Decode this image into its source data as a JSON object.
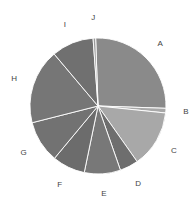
{
  "chart_data": {
    "type": "pie",
    "title": "",
    "categories": [
      "A",
      "B",
      "C",
      "D",
      "E",
      "F",
      "G",
      "H",
      "I",
      "J"
    ],
    "values": [
      26.1,
      1.1,
      13.6,
      4.4,
      8.6,
      7.8,
      10.0,
      17.8,
      10.0,
      0.6
    ],
    "colors": [
      "#8a8a8a",
      "#a8a8a8",
      "#a8a8a8",
      "#6e6e6e",
      "#787878",
      "#6c6c6c",
      "#727272",
      "#767676",
      "#707070",
      "#9a9a9a"
    ],
    "start_angle_deg": -2,
    "direction": "clockwise",
    "legend": "none",
    "labels_outside": true
  },
  "geometry": {
    "cx": 98,
    "cy": 106,
    "r": 68,
    "label_r": 88
  }
}
